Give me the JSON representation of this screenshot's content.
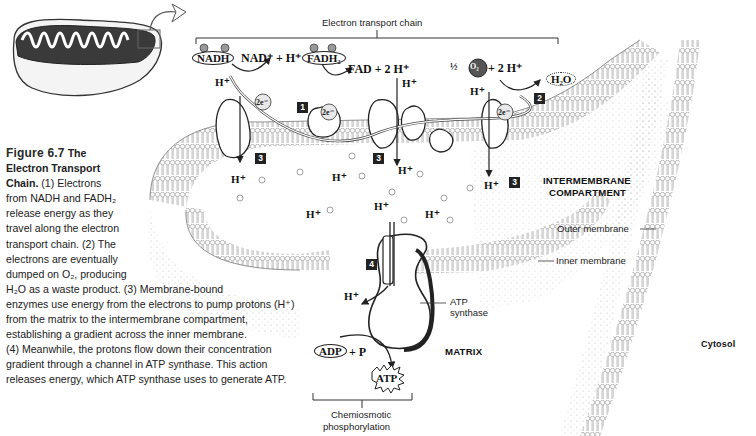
{
  "caption": {
    "figure_label": "Figure 6.7",
    "title": "The Electron Transport Chain.",
    "title_part1": "The",
    "title_part2": "Electron Transport",
    "title_part3": "Chain.",
    "lines": [
      "(1) Electrons",
      "from NADH and FADH₂",
      "release energy as they",
      "travel along the electron",
      "transport chain. (2) The",
      "electrons are eventually",
      "dumped on O₂, producing",
      "H₂O as a waste product. (3) Membrane-bound",
      "enzymes use energy from the electrons to pump protons (H⁺)",
      "from the matrix to the intermembrane compartment,",
      "establishing a gradient across the inner membrane.",
      "(4) Meanwhile, the protons flow down their concentration",
      "gradient through a channel in ATP synthase. This action",
      "releases energy, which ATP synthase uses to generate ATP."
    ]
  },
  "diagram": {
    "etc_label": "Electron transport chain",
    "nadh": "NADH",
    "nad_plus": "NAD⁺ + H⁺",
    "fadh2": "FADH₂",
    "fad": "FAD + 2 H⁺",
    "half": "½",
    "o2": "O₂",
    "plus_2h": "+ 2 H⁺",
    "h2o": "H₂O",
    "electrons": "2e⁻",
    "h_plus": "H⁺",
    "steps": {
      "one": "1",
      "two": "2",
      "three": "3",
      "four": "4"
    },
    "intermembrane_line1": "INTERMEMBRANE",
    "intermembrane_line2": "COMPARTMENT",
    "outer_membrane": "Outer membrane",
    "inner_membrane": "Inner membrane",
    "atp_synthase_line1": "ATP",
    "atp_synthase_line2": "synthase",
    "matrix": "MATRIX",
    "cytosol": "Cytosol",
    "adp": "ADP",
    "plus_p": "+ P",
    "atp": "ATP",
    "chemiosmotic_line1": "Chemiosmotic",
    "chemiosmotic_line2": "phosphorylation"
  }
}
